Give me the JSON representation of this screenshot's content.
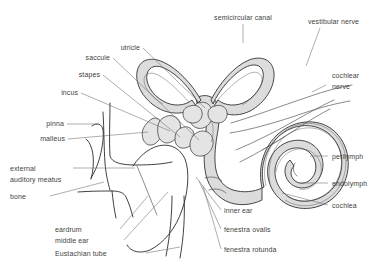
{
  "figure": {
    "background_color": "#ffffff",
    "line_color": "#2b2b2b",
    "fill_color": "#dcdcdc",
    "label_color": "#3f3f3f",
    "leader_color": "#6a6a6a"
  },
  "labels": {
    "semicircular_canal": "semicircular canal",
    "vestibular_nerve": "vestibular nerve",
    "cochlear_nerve_line1": "cochlear",
    "cochlear_nerve_line2": "nerve",
    "utricle": "utricle",
    "saccule": "saccule",
    "stapes": "stapes",
    "incus": "incus",
    "pinna": "pinna",
    "malleus": "malleus",
    "external_line1": "external",
    "external_line2": "auditory meatus",
    "bone": "bone",
    "eardrum": "eardrum",
    "middle_ear": "middle ear",
    "eustachian_tube": "Eustachian tube",
    "inner_ear": "inner ear",
    "fenestra_ovalis": "fenestra ovalis",
    "fenestra_rotunda": "fenestra rotunda",
    "perilymph": "perilymph",
    "endolymph": "endolymph",
    "cochlea": "cochlea"
  }
}
